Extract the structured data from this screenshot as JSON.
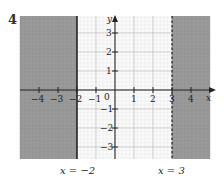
{
  "question_number": "4",
  "chart_data": {
    "type": "inequality-region",
    "x_range": [
      -5,
      5
    ],
    "y_range": [
      -3.7,
      3.7
    ],
    "x_ticks": [
      "-4",
      "-3",
      "-2",
      "-1",
      "0",
      "1",
      "2",
      "3",
      "4"
    ],
    "y_ticks": [
      "3",
      "2",
      "1",
      "-1",
      "-2",
      "-3"
    ],
    "axis_labels": {
      "x": "x",
      "y": "y"
    },
    "lines": [
      {
        "equation": "x = -2",
        "style": "solid",
        "label": "x = −2"
      },
      {
        "equation": "x = 3",
        "style": "dashed",
        "label": "x = 3"
      }
    ],
    "shaded_regions": [
      {
        "description": "x ≤ -2 (left of x=-2)",
        "color": "#8a8a8a"
      },
      {
        "description": "x > 3 (right of x=3)",
        "color": "#8a8a8a"
      }
    ],
    "grid": true,
    "unshaded_region": "-2 < x ≤ 3"
  },
  "labels": {
    "line_left": "x = −2",
    "line_right": "x = 3",
    "x_axis": "x",
    "y_axis": "y",
    "origin": "0"
  }
}
